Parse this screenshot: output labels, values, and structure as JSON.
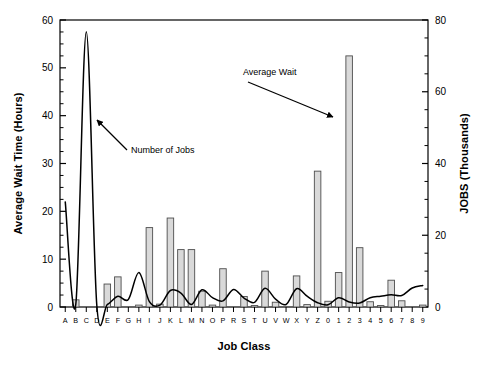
{
  "figure": {
    "background_color": "#ffffff",
    "axis_color": "#000000",
    "bar_fill_color": "#d9d9d9",
    "bar_edge_color": "#4d4d4d",
    "line_color": "#000000"
  },
  "axes": {
    "x_title": "Job Class",
    "y_left_title": "Average Wait Time (Hours)",
    "y_right_title": "JOBS (Thousands)",
    "y_left_ticks": [
      "0",
      "10",
      "20",
      "30",
      "40",
      "50",
      "60"
    ],
    "y_right_ticks": [
      "0",
      "20",
      "40",
      "60",
      "80"
    ]
  },
  "annotations": [
    {
      "name": "number-of-jobs",
      "text": "Number of Jobs"
    },
    {
      "name": "average-wait",
      "text": "Average Wait"
    }
  ],
  "chart_data": {
    "type": "bar",
    "title": "",
    "subtitle": "",
    "xlabel": "Job Class",
    "ylabel": "Average Wait Time (Hours)",
    "y2label": "JOBS (Thousands)",
    "ylim": [
      0,
      60
    ],
    "y2lim": [
      0,
      80
    ],
    "grid": false,
    "legend": "none",
    "categories": [
      "A",
      "B",
      "C",
      "D",
      "E",
      "F",
      "G",
      "H",
      "I",
      "J",
      "K",
      "L",
      "M",
      "N",
      "O",
      "P",
      "R",
      "S",
      "T",
      "U",
      "V",
      "W",
      "X",
      "Y",
      "Z",
      "0",
      "1",
      "2",
      "3",
      "4",
      "5",
      "6",
      "7",
      "8",
      "9"
    ],
    "series": [
      {
        "name": "Average Wait",
        "plot": "bar",
        "axis": "left",
        "unit": "Hours",
        "values": [
          0.0,
          1.5,
          0.0,
          0.0,
          4.8,
          6.3,
          0.0,
          0.4,
          16.6,
          0.6,
          18.6,
          12.0,
          12.0,
          3.3,
          0.4,
          8.0,
          0.0,
          2.2,
          0.3,
          7.5,
          1.0,
          0.0,
          6.5,
          0.5,
          28.4,
          1.2,
          7.2,
          52.5,
          12.4,
          1.1,
          0.3,
          5.6,
          1.3,
          0.0,
          0.4
        ]
      },
      {
        "name": "Number of Jobs",
        "plot": "line",
        "axis": "right",
        "unit": "Thousands",
        "values": [
          29.3,
          0.7,
          76.7,
          0.5,
          0.7,
          3.0,
          2.1,
          9.6,
          1.5,
          0.5,
          4.6,
          3.9,
          0.7,
          4.8,
          2.6,
          1.7,
          4.9,
          2.5,
          1.3,
          5.2,
          2.2,
          0.7,
          5.1,
          3.0,
          1.2,
          0.6,
          2.6,
          1.4,
          1.1,
          2.6,
          3.0,
          3.4,
          3.2,
          5.3,
          6.0
        ]
      }
    ]
  }
}
